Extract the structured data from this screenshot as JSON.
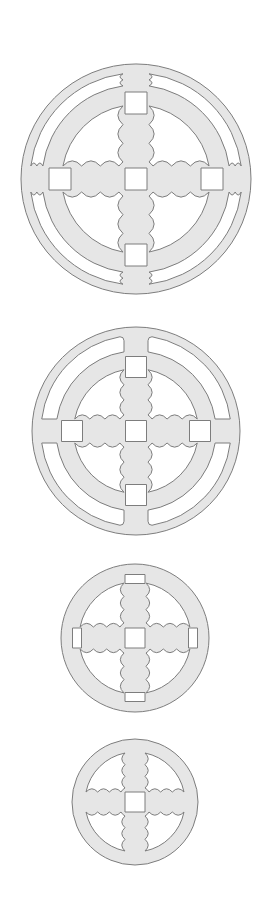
{
  "diagram": {
    "title": "",
    "colors": {
      "background": "#ffffff",
      "fill": "#e6e6e6",
      "stroke": "#7d7d7d"
    },
    "discs": [
      {
        "name": "disc-1-double-ring-leaf-arms",
        "cx": 136,
        "cy": 179,
        "r": 115,
        "outer_ring": true,
        "outer_ring_width": 9,
        "outer_cusps": true,
        "inner_ring_r": 76,
        "inner_ring_width": 18,
        "arm_half_width": 13,
        "squares": [
          {
            "dx": 0,
            "dy": 0,
            "s": 22
          },
          {
            "dx": 0,
            "dy": -76,
            "s": 22
          },
          {
            "dx": 0,
            "dy": 76,
            "s": 22
          },
          {
            "dx": -76,
            "dy": 0,
            "s": 22
          },
          {
            "dx": 76,
            "dy": 0,
            "s": 22
          }
        ],
        "leaf_windows": true,
        "leaf_r": 58
      },
      {
        "name": "disc-2-double-ring-plain-slots",
        "cx": 136,
        "cy": 431,
        "r": 104,
        "outer_ring": true,
        "outer_ring_width": 9,
        "outer_cusps": false,
        "inner_ring_r": 64,
        "inner_ring_width": 16,
        "arm_half_width": 12,
        "squares": [
          {
            "dx": 0,
            "dy": 0,
            "s": 21
          },
          {
            "dx": 0,
            "dy": -64,
            "s": 21
          },
          {
            "dx": 0,
            "dy": 64,
            "s": 21
          },
          {
            "dx": -64,
            "dy": 0,
            "s": 21
          },
          {
            "dx": 64,
            "dy": 0,
            "s": 21
          }
        ],
        "leaf_windows": true,
        "leaf_r": 48
      },
      {
        "name": "disc-3-single-ring-with-slots",
        "cx": 135,
        "cy": 638,
        "r": 74,
        "outer_ring": false,
        "arm_half_width": 11,
        "squares": [
          {
            "dx": 0,
            "dy": 0,
            "s": 20
          }
        ],
        "slots": [
          {
            "dx": 0,
            "dy": -59,
            "w": 20,
            "h": 9
          },
          {
            "dx": 0,
            "dy": 59,
            "w": 20,
            "h": 9
          },
          {
            "dx": -58,
            "dy": 0,
            "w": 9,
            "h": 20
          },
          {
            "dx": 58,
            "dy": 0,
            "w": 9,
            "h": 20
          }
        ],
        "leaf_windows": true,
        "leaf_r": 56
      },
      {
        "name": "disc-4-single-ring-center-square",
        "cx": 135,
        "cy": 802,
        "r": 63,
        "outer_ring": false,
        "arm_half_width": 10,
        "squares": [
          {
            "dx": 0,
            "dy": 0,
            "s": 20
          }
        ],
        "slots": [],
        "leaf_windows": true,
        "leaf_r": 50
      }
    ]
  }
}
